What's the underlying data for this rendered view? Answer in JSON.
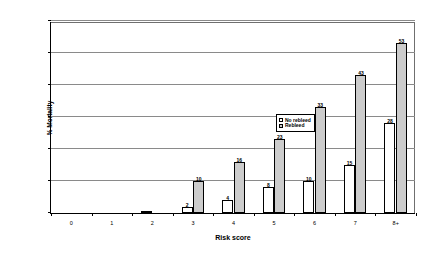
{
  "chart_data": {
    "type": "bar",
    "title": "",
    "xlabel": "Risk score",
    "ylabel": "% Mortality",
    "categories": [
      "0",
      "1",
      "2",
      "3",
      "4",
      "5",
      "6",
      "7",
      "8+"
    ],
    "ylim": [
      0,
      60
    ],
    "yticks": [
      0,
      10,
      20,
      30,
      40,
      50,
      60
    ],
    "grid": true,
    "legend_position": "upper-center",
    "series": [
      {
        "name": "No rebleed",
        "color": "#ffffff",
        "values": [
          0,
          0,
          0.5,
          2,
          4,
          8,
          10,
          15,
          28
        ],
        "labels": [
          "",
          "",
          "",
          "2",
          "4",
          "8",
          "10",
          "15",
          "28"
        ]
      },
      {
        "name": "Rebleed",
        "color": "#cccccc",
        "values": [
          0,
          0,
          0,
          10,
          16,
          23,
          33,
          43,
          53
        ],
        "labels": [
          "",
          "",
          "",
          "10",
          "16",
          "23",
          "33",
          "43",
          "53"
        ]
      }
    ]
  },
  "legend": {
    "items": [
      {
        "label": "No rebleed",
        "swatch": "nr"
      },
      {
        "label": "Rebleed",
        "swatch": "rb"
      }
    ]
  }
}
